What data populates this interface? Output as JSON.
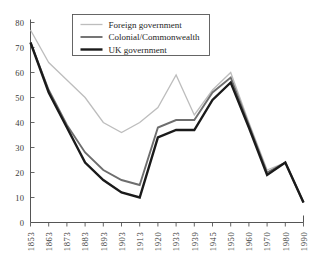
{
  "chart_data": {
    "type": "line",
    "title": "",
    "subtitle": "",
    "xlabel": "",
    "ylabel": "",
    "xlim": [
      0,
      15
    ],
    "ylim": [
      0,
      80
    ],
    "grid": false,
    "legend_position": "top-center",
    "categories": [
      "1853",
      "1863",
      "1873",
      "1883",
      "1893",
      "1903",
      "1913",
      "1920",
      "1933",
      "1939",
      "1945",
      "1950",
      "1960",
      "1970",
      "1980",
      "1990"
    ],
    "y_ticks": [
      "0",
      "10",
      "20",
      "30",
      "40",
      "50",
      "60",
      "70",
      "80"
    ],
    "y_tick_values": [
      0,
      10,
      20,
      30,
      40,
      50,
      60,
      70,
      80
    ],
    "series": [
      {
        "name": "Foreign government",
        "color": "#bdbdbd",
        "width": 1.3,
        "values": [
          77,
          64,
          57,
          50,
          40,
          36,
          40,
          46,
          59,
          43,
          53,
          60,
          40,
          21,
          24,
          8
        ]
      },
      {
        "name": "Colonial/Commonwealth",
        "color": "#6e6e6e",
        "width": 1.9,
        "values": [
          72,
          53,
          39,
          28,
          21,
          17,
          15,
          38,
          41,
          41,
          52,
          58,
          39,
          20,
          24,
          8
        ]
      },
      {
        "name": "UK government",
        "color": "#1a1a1a",
        "width": 2.4,
        "values": [
          72,
          52,
          38,
          24,
          17,
          12,
          10,
          34,
          37,
          37,
          49,
          56,
          38,
          19,
          24,
          8
        ]
      }
    ]
  },
  "legend": {
    "items": [
      {
        "label": "Foreign government"
      },
      {
        "label": "Colonial/Commonwealth"
      },
      {
        "label": "UK government"
      }
    ]
  }
}
